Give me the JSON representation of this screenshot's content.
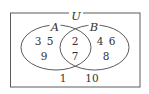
{
  "diagram": {
    "type": "venn",
    "universe": {
      "label": "U",
      "rect": {
        "x": 10.5,
        "y": 13,
        "width": 129.5,
        "height": 74
      },
      "label_pos": {
        "x": 76,
        "y": 17
      }
    },
    "sets": [
      {
        "label": "A",
        "ellipse": {
          "cx": 56,
          "cy": 47.5,
          "rx": 35,
          "ry": 22.5
        },
        "label_pos": {
          "x": 55,
          "y": 28
        }
      },
      {
        "label": "B",
        "ellipse": {
          "cx": 94.5,
          "cy": 47.5,
          "rx": 34.5,
          "ry": 22.5
        },
        "label_pos": {
          "x": 94,
          "y": 28
        }
      }
    ],
    "regions": {
      "only_A": [
        {
          "value": "3",
          "x": 38,
          "y": 45
        },
        {
          "value": "5",
          "x": 50,
          "y": 45
        },
        {
          "value": "9",
          "x": 44,
          "y": 60
        }
      ],
      "A_and_B": [
        {
          "value": "2",
          "x": 75,
          "y": 45
        },
        {
          "value": "7",
          "x": 75,
          "y": 60
        }
      ],
      "only_B": [
        {
          "value": "4",
          "x": 100,
          "y": 45
        },
        {
          "value": "6",
          "x": 112,
          "y": 45
        },
        {
          "value": "8",
          "x": 106,
          "y": 60
        }
      ],
      "outside": [
        {
          "value": "1",
          "x": 63,
          "y": 82
        },
        {
          "value": "10",
          "x": 92,
          "y": 82
        }
      ]
    },
    "colors": {
      "stroke": "#5a5a5a",
      "text": "#333333",
      "background": "#ffffff"
    }
  }
}
